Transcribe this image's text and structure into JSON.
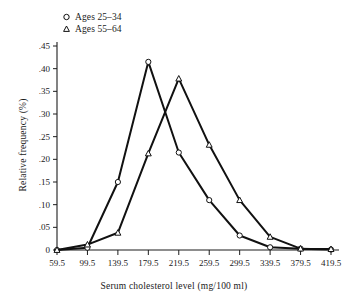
{
  "chart_data": {
    "type": "line",
    "title": "",
    "xlabel": "Serum cholesterol level (mg/100 ml)",
    "ylabel": "Relative frequency (%)",
    "categories": [
      "59.5",
      "99.5",
      "139.5",
      "179.5",
      "219.5",
      "259.5",
      "299.5",
      "339.5",
      "379.5",
      "419.5"
    ],
    "x": [
      59.5,
      99.5,
      139.5,
      179.5,
      219.5,
      259.5,
      299.5,
      339.5,
      379.5,
      419.5
    ],
    "xlim": [
      59.5,
      419.5
    ],
    "ylim": [
      0,
      0.45
    ],
    "grid": false,
    "legend_position": "top-left",
    "xticks": [
      "59.5",
      "99.5",
      "139.5",
      "179.5",
      "219.5",
      "259.5",
      "299.5",
      "339.5",
      "379.5",
      "419.5"
    ],
    "yticks": [
      "0",
      ".05",
      ".10",
      ".15",
      ".20",
      ".25",
      ".30",
      ".35",
      ".40",
      ".45"
    ],
    "ytick_values": [
      0,
      0.05,
      0.1,
      0.15,
      0.2,
      0.25,
      0.3,
      0.35,
      0.4,
      0.45
    ],
    "series": [
      {
        "name": "Ages 25–34",
        "marker": "circle",
        "values": [
          0.0,
          0.005,
          0.15,
          0.415,
          0.215,
          0.11,
          0.032,
          0.006,
          0.003,
          0.001
        ]
      },
      {
        "name": "Ages 55–64",
        "marker": "triangle",
        "values": [
          0.0,
          0.012,
          0.038,
          0.213,
          0.378,
          0.232,
          0.11,
          0.029,
          0.003,
          0.002
        ]
      }
    ]
  },
  "legend": {
    "items": [
      {
        "label": "Ages 25–34",
        "marker": "circle-marker-icon"
      },
      {
        "label": "Ages 55–64",
        "marker": "triangle-marker-icon"
      }
    ]
  },
  "axes": {
    "x_title": "Serum cholesterol level (mg/100 ml)",
    "y_title": "Relative frequency (%)"
  },
  "colors": {
    "line": "#111111",
    "axis": "#1d1d1d",
    "marker_fill": "#ffffff",
    "background": "#ffffff"
  }
}
